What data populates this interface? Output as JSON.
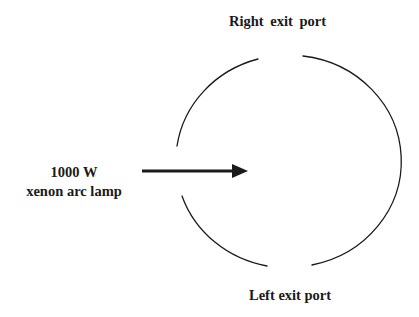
{
  "diagram": {
    "labels": {
      "right_port": "Right  exit port",
      "left_port": "Left exit port",
      "lamp_line1": "1000 W",
      "lamp_line2": "xenon arc lamp"
    },
    "colors": {
      "stroke": "#1a1a1a",
      "background": "#ffffff"
    },
    "elements": [
      {
        "type": "circle-with-gaps",
        "name": "sphere",
        "gaps": [
          "top (right exit port)",
          "bottom (left exit port)",
          "left (lamp input)"
        ]
      },
      {
        "type": "arrow",
        "name": "lamp-beam",
        "direction": "right"
      }
    ]
  }
}
